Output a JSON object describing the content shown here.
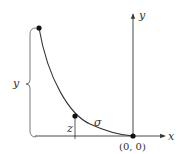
{
  "diagram": {
    "labels": {
      "y_axis": "y",
      "x_axis": "x",
      "origin": "(0, 0)",
      "height_brace": "y",
      "z": "z",
      "curve": "σ"
    },
    "colors": {
      "stroke": "#333333",
      "point": "#111111"
    },
    "points": [
      {
        "name": "top-point",
        "x": 39,
        "y": 28
      },
      {
        "name": "mid-point",
        "x": 75,
        "y": 116
      },
      {
        "name": "origin-point",
        "x": 133,
        "y": 136
      }
    ]
  }
}
